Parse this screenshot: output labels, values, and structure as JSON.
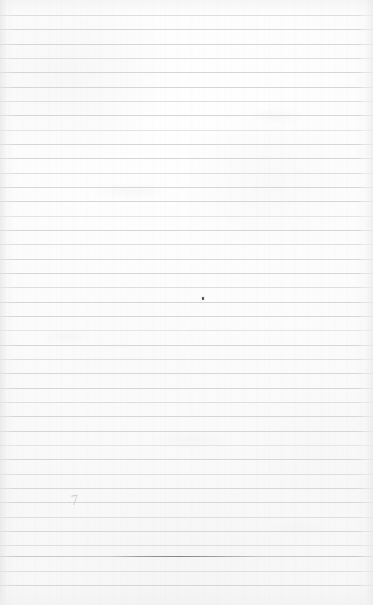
{
  "document": {
    "kind": "lined-paper-scan",
    "title": "Blank ruled notebook page",
    "description": "Scanned sheet of blank wide-ruled notebook paper, no written text",
    "page_width": 373,
    "page_height": 605,
    "paper_color": "#fdfdfd",
    "paper_edge_shadow_color": "#dedede",
    "visible_text": ""
  },
  "ruling": {
    "line_color": "#d8d8d8",
    "line_color_faint": "#e4e4e4",
    "line_color_heavy": "#b4b4b4",
    "line_thickness_px": 1,
    "line_spacing_px": 14.3,
    "first_line_y": 15,
    "line_start_x": 7,
    "line_end_x": 358,
    "line_count": 40,
    "bottom_margin_y": 586,
    "lines": [
      {
        "y": 15,
        "weight": "light"
      },
      {
        "y": 29,
        "weight": "normal"
      },
      {
        "y": 44,
        "weight": "normal"
      },
      {
        "y": 58,
        "weight": "light"
      },
      {
        "y": 72,
        "weight": "normal"
      },
      {
        "y": 87,
        "weight": "normal"
      },
      {
        "y": 101,
        "weight": "light"
      },
      {
        "y": 115,
        "weight": "normal"
      },
      {
        "y": 130,
        "weight": "faint"
      },
      {
        "y": 144,
        "weight": "normal"
      },
      {
        "y": 158,
        "weight": "normal"
      },
      {
        "y": 173,
        "weight": "light"
      },
      {
        "y": 187,
        "weight": "normal"
      },
      {
        "y": 201,
        "weight": "normal"
      },
      {
        "y": 216,
        "weight": "faint"
      },
      {
        "y": 230,
        "weight": "normal"
      },
      {
        "y": 244,
        "weight": "light"
      },
      {
        "y": 259,
        "weight": "normal"
      },
      {
        "y": 273,
        "weight": "normal"
      },
      {
        "y": 287,
        "weight": "light"
      },
      {
        "y": 302,
        "weight": "normal"
      },
      {
        "y": 316,
        "weight": "normal"
      },
      {
        "y": 330,
        "weight": "faint"
      },
      {
        "y": 345,
        "weight": "normal"
      },
      {
        "y": 359,
        "weight": "light"
      },
      {
        "y": 373,
        "weight": "normal"
      },
      {
        "y": 388,
        "weight": "normal"
      },
      {
        "y": 402,
        "weight": "light"
      },
      {
        "y": 416,
        "weight": "normal"
      },
      {
        "y": 431,
        "weight": "normal"
      },
      {
        "y": 445,
        "weight": "faint"
      },
      {
        "y": 459,
        "weight": "normal"
      },
      {
        "y": 474,
        "weight": "light"
      },
      {
        "y": 488,
        "weight": "normal"
      },
      {
        "y": 502,
        "weight": "normal"
      },
      {
        "y": 517,
        "weight": "light"
      },
      {
        "y": 531,
        "weight": "normal"
      },
      {
        "y": 545,
        "weight": "light"
      },
      {
        "y": 556,
        "weight": "strong"
      },
      {
        "y": 571,
        "weight": "light"
      },
      {
        "y": 585,
        "weight": "normal"
      }
    ]
  },
  "marks": {
    "ink_speck": {
      "label": "ink-speck",
      "x": 202,
      "y": 297,
      "color": "#4a4a52"
    },
    "pencil_mark": {
      "label": "pencil-mark",
      "glyph": "7",
      "x": 71,
      "y": 493,
      "color": "#c2c2c6"
    },
    "dark_rule_segment": {
      "label": "dark-rule-segment",
      "y": 556,
      "x_start": 110,
      "x_end": 262,
      "color": "#808080"
    },
    "smudges": [
      {
        "x": 95,
        "y": 182,
        "w": 70,
        "h": 18,
        "opacity": 0.22
      },
      {
        "x": 248,
        "y": 108,
        "w": 58,
        "h": 16,
        "opacity": 0.18
      },
      {
        "x": 150,
        "y": 430,
        "w": 84,
        "h": 20,
        "opacity": 0.16
      },
      {
        "x": 40,
        "y": 330,
        "w": 52,
        "h": 14,
        "opacity": 0.2
      },
      {
        "x": 268,
        "y": 520,
        "w": 62,
        "h": 16,
        "opacity": 0.16
      }
    ]
  }
}
